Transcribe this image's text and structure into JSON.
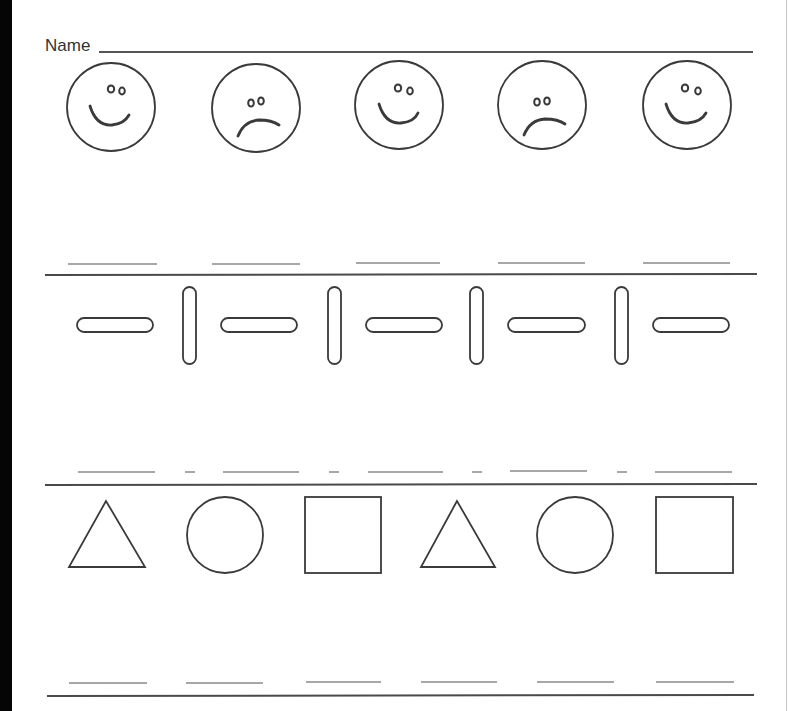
{
  "worksheet": {
    "name_label": "Name",
    "ink_color": "#3a3a3a",
    "rows": [
      {
        "id": "faces",
        "pattern": [
          "happy-face",
          "sad-face",
          "happy-face",
          "sad-face",
          "happy-face"
        ],
        "answer_blanks": 5
      },
      {
        "id": "bars",
        "pattern": [
          "horizontal-bar",
          "vertical-bar",
          "horizontal-bar",
          "vertical-bar",
          "horizontal-bar",
          "vertical-bar",
          "horizontal-bar",
          "vertical-bar",
          "horizontal-bar"
        ],
        "answer_blanks": 9
      },
      {
        "id": "shapes",
        "pattern": [
          "triangle",
          "circle",
          "square",
          "triangle",
          "circle",
          "square"
        ],
        "answer_blanks": 6
      }
    ]
  }
}
